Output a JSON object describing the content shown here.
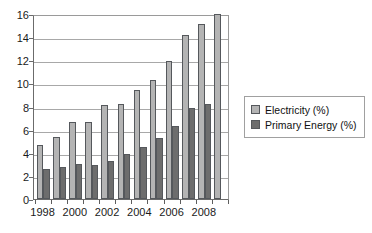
{
  "chart_data": {
    "type": "bar",
    "title": "",
    "subtitle": "",
    "xlabel": "",
    "ylabel": "",
    "ylim": [
      0,
      16
    ],
    "ytick_step": 2,
    "yticks": [
      "0",
      "2",
      "4",
      "6",
      "8",
      "10",
      "12",
      "14",
      "16"
    ],
    "grid": true,
    "grid_axis": "y",
    "legend_position": "right",
    "categories": [
      "1998",
      "1999",
      "2000",
      "2001",
      "2002",
      "2003",
      "2004",
      "2005",
      "2006",
      "2007",
      "2008",
      "2009"
    ],
    "xtick_labels_shown": [
      "1998",
      "2000",
      "2002",
      "2004",
      "2006",
      "2008"
    ],
    "series": [
      {
        "name": "Electricity (%)",
        "color": "#b4b4b4",
        "values": [
          4.7,
          5.4,
          6.7,
          6.7,
          8.1,
          8.2,
          9.4,
          10.3,
          11.9,
          14.2,
          15.1,
          16.0
        ]
      },
      {
        "name": "Primary Energy (%)",
        "color": "#6d6d6d",
        "values": [
          2.6,
          2.8,
          3.0,
          2.9,
          3.3,
          3.9,
          4.5,
          5.3,
          6.3,
          7.9,
          8.2,
          null
        ]
      }
    ]
  },
  "legend": {
    "items": [
      {
        "label": "Electricity (%)",
        "swatch": "legend-swatch-electricity"
      },
      {
        "label": "Primary Energy (%)",
        "swatch": "legend-swatch-primary-energy"
      }
    ]
  }
}
